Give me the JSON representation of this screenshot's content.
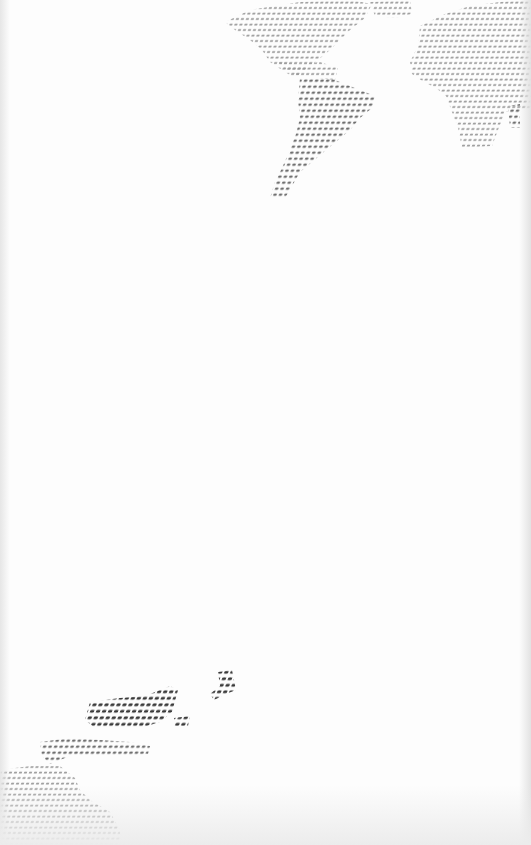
{
  "wallpaper": {
    "background": "#fdfdfd",
    "dot_colors": {
      "light": "#9a9a9a",
      "mid": "#6e6e6e",
      "dark": "#3a3a3a"
    },
    "regions": [
      {
        "name": "north-america",
        "tone": "light",
        "points": "225,22 250,10 300,2 350,0 372,4 365,18 350,30 340,40 330,50 318,60 305,70 295,78 285,72 270,62 262,50 250,40 235,30"
      },
      {
        "name": "greenland",
        "tone": "light",
        "points": "370,2 410,0 412,14 395,18 375,16"
      },
      {
        "name": "central-america",
        "tone": "light",
        "points": "278,62 300,64 320,62 338,68 335,80 318,78 300,76 288,72"
      },
      {
        "name": "south-america",
        "tone": "mid",
        "points": "300,78 330,78 355,88 375,96 372,108 360,118 350,130 338,140 326,150 312,162 300,172 292,186 285,198 270,198 275,182 282,168 290,150 296,134 300,118 298,100"
      },
      {
        "name": "europe-africa",
        "tone": "light",
        "points": "420,26 445,14 470,6 500,2 531,0 531,110 520,110 505,112 498,130 492,146 462,148 458,128 452,112 446,96 436,88 424,82 412,74 410,62 418,46"
      },
      {
        "name": "madagascar",
        "tone": "mid",
        "points": "508,106 520,104 520,128 510,128"
      },
      {
        "name": "asia-southeast",
        "tone": "dark",
        "points": "90,702 120,698 145,696 170,686 178,690 172,712 160,722 140,728 118,728 95,728 85,720"
      },
      {
        "name": "japan",
        "tone": "dark",
        "points": "218,672 232,670 236,690 226,694 214,700 210,694 220,686"
      },
      {
        "name": "philippines",
        "tone": "dark",
        "points": "174,718 190,716 188,726 174,726"
      },
      {
        "name": "indonesia",
        "tone": "mid",
        "points": "40,742 70,738 100,740 130,742 150,746 148,754 125,756 100,756 70,756 50,764 42,756"
      },
      {
        "name": "australia",
        "tone": "light",
        "points": "0,770 30,766 60,766 75,778 80,790 90,800 110,812 120,830 120,845 0,845"
      }
    ]
  }
}
